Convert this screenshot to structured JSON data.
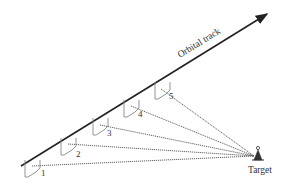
{
  "diagram": {
    "track_label": "Orbital track",
    "target_label": "Target",
    "positions": [
      {
        "id": "1",
        "label": "1"
      },
      {
        "id": "2",
        "label": "2"
      },
      {
        "id": "3",
        "label": "3"
      },
      {
        "id": "4",
        "label": "4"
      },
      {
        "id": "5",
        "label": "5"
      }
    ],
    "colors": {
      "track": "#222222",
      "ray": "#555555",
      "symbol": "#888888",
      "text": "#333333"
    }
  }
}
